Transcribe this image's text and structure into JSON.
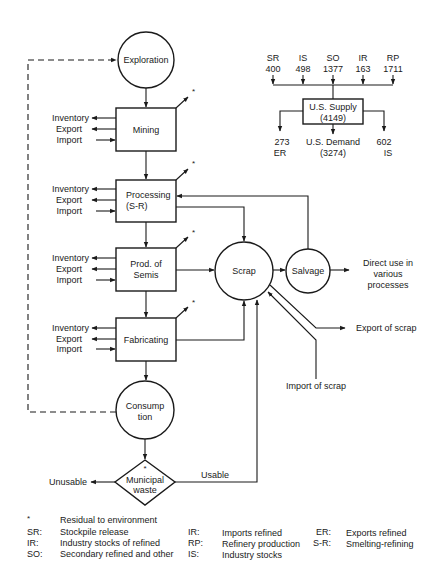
{
  "nodes": {
    "exploration": "Exploration",
    "mining": "Mining",
    "processing_l1": "Processing",
    "processing_l2": "(S-R)",
    "semis_l1": "Prod. of",
    "semis_l2": "Semis",
    "fabricating": "Fabricating",
    "consumption_l1": "Consump",
    "consumption_l2": "tion",
    "waste_l1": "Municipal",
    "waste_l2": "waste",
    "scrap": "Scrap",
    "salvage": "Salvage"
  },
  "side_flows": {
    "inventory": "Inventory",
    "export": "Export",
    "import": "Import"
  },
  "residual_marker": "*",
  "outputs": {
    "direct_use_l1": "Direct use in",
    "direct_use_l2": "various",
    "direct_use_l3": "processes",
    "export_scrap": "Export of scrap",
    "import_scrap": "Import of scrap",
    "unusable": "Unusable",
    "usable": "Usable"
  },
  "supply": {
    "inputs": [
      {
        "code": "SR",
        "value": "400"
      },
      {
        "code": "IS",
        "value": "498"
      },
      {
        "code": "SO",
        "value": "1377"
      },
      {
        "code": "IR",
        "value": "163"
      },
      {
        "code": "RP",
        "value": "1711"
      }
    ],
    "box_l1": "U.S. Supply",
    "box_l2": "(4149)",
    "out_left_value": "273",
    "out_left_code": "ER",
    "demand_l1": "U.S. Demand",
    "demand_l2": "(3274)",
    "out_right_value": "602",
    "out_right_code": "IS"
  },
  "legend": {
    "star": {
      "key": "*",
      "text": "Residual to environment"
    },
    "col1": [
      {
        "key": "SR:",
        "text": "Stockpile release"
      },
      {
        "key": "IR:",
        "text": "Industry stocks of refined"
      },
      {
        "key": "SO:",
        "text": "Secondary refined and other"
      }
    ],
    "col2": [
      {
        "key": "IR:",
        "text": "Imports refined"
      },
      {
        "key": "RP:",
        "text": "Refinery production"
      },
      {
        "key": "IS:",
        "text": "Industry stocks"
      }
    ],
    "col3": [
      {
        "key": "ER:",
        "text": "Exports refined"
      },
      {
        "key": "S-R:",
        "text": "Smelting-refining"
      }
    ]
  }
}
